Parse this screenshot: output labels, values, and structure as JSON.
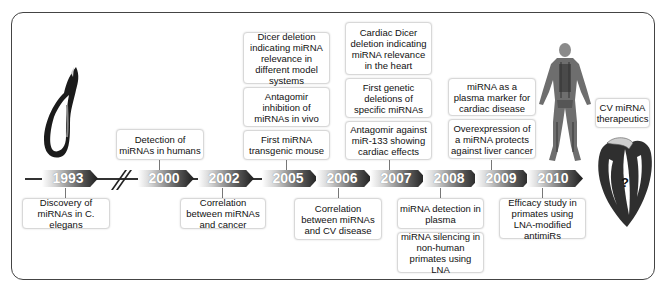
{
  "figure": {
    "type": "timeline"
  },
  "timeline": {
    "years": [
      "1993",
      "2000",
      "2002",
      "2005",
      "2006",
      "2007",
      "2008",
      "2009",
      "2010"
    ],
    "break_marker": "//"
  },
  "events": {
    "y1993": [
      "Discovery of miRNAs in C. elegans"
    ],
    "y2000": [
      "Detection of miRNAs in humans"
    ],
    "y2002": [
      "Correlation between miRNAs and cancer"
    ],
    "y2005": [
      "Dicer deletion indicating miRNA relevance in different model systems",
      "Antagomir inhibition of miRNAs in vivo",
      "First miRNA transgenic mouse"
    ],
    "y2006": [
      "Correlation between miRNAs and CV disease"
    ],
    "y2007": [
      "Cardiac Dicer deletion indicating miRNA relevance in the heart",
      "First genetic deletions of specific miRNAs",
      "Antagomir against miR-133 showing cardiac effects"
    ],
    "y2008": [
      "miRNA detection in plasma",
      "miRNA silencing in non-human primates using LNA"
    ],
    "y2009": [
      "miRNA as a plasma marker for cardiac disease",
      "Overexpression of a miRNA protects against liver cancer"
    ],
    "y2010": [
      "Efficacy study in primates using LNA-modified antimiRs"
    ],
    "future": [
      "CV miRNA therapeutics"
    ]
  },
  "illustrations": {
    "worm": "c-elegans-worm",
    "human": "human-anatomy-figure",
    "heart": "heart-cross-section",
    "heart_label": "?"
  }
}
